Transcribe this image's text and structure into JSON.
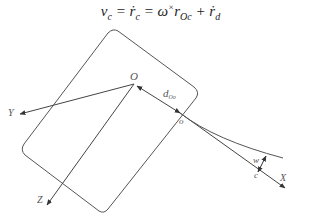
{
  "formula": {
    "lhs": "v",
    "lhs_sub": "c",
    "eq1": " = ",
    "term1": "ṙ",
    "term1_sub": "c",
    "eq2": " = ",
    "term2": "ω",
    "term2_sup": "×",
    "term3": "r",
    "term3_sub": "Oc",
    "plus": " + ",
    "term4": "ṙ",
    "term4_sub": "d"
  },
  "labels": {
    "origin": "O",
    "y_axis": "Y",
    "z_axis": "Z",
    "x_axis": "X",
    "distance": "d",
    "distance_sub": "Oo",
    "point_o": "o",
    "width": "w",
    "point_c": "c"
  },
  "colors": {
    "stroke": "#444444",
    "text": "#555555"
  }
}
